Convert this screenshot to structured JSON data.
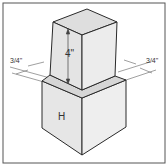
{
  "diagram": {
    "type": "isometric-stacked-cubes",
    "labels": {
      "height": "4\"",
      "left_offset": "3/4\"",
      "right_offset": "3/4\"",
      "bottom_face": "H"
    },
    "colors": {
      "face_left": "#e4e4e4",
      "face_right": "#ececec",
      "face_top": "#dcdcdc",
      "ledge": "#d4d4d4",
      "stroke": "#2a2a2a",
      "frame": "#555555",
      "dim_line": "#777777"
    }
  }
}
